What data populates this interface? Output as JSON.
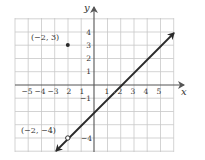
{
  "figure": {
    "type": "coordinate-graph",
    "colors": {
      "grid": "#c8c8c8",
      "axis": "#555555",
      "line": "#2a2a2a",
      "text": "#333333",
      "background": "#ffffff"
    },
    "axes": {
      "x_label": "x",
      "y_label": "y",
      "x_ticks": [
        {
          "value": -5,
          "label": "−5"
        },
        {
          "value": -4,
          "label": "−4"
        },
        {
          "value": -3,
          "label": "−3"
        },
        {
          "value": -2,
          "label": "2"
        },
        {
          "value": -1,
          "label": "1"
        },
        {
          "value": 1,
          "label": "1"
        },
        {
          "value": 2,
          "label": "2"
        },
        {
          "value": 3,
          "label": "3"
        },
        {
          "value": 4,
          "label": "4"
        },
        {
          "value": 5,
          "label": "5"
        }
      ],
      "y_ticks": [
        {
          "value": 4,
          "label": "4"
        },
        {
          "value": 3,
          "label": "3"
        },
        {
          "value": 2,
          "label": "2"
        },
        {
          "value": 1,
          "label": "1"
        },
        {
          "value": -1,
          "label": "−1"
        },
        {
          "value": -4,
          "label": "−4"
        }
      ],
      "x_range": [
        -6,
        6
      ],
      "y_range": [
        -5,
        5
      ]
    },
    "points": [
      {
        "x": -2,
        "y": 3,
        "label": "(−2, 3)",
        "style": "filled"
      },
      {
        "x": -2,
        "y": -4,
        "label": "(−2, −4)",
        "style": "open"
      }
    ],
    "line": {
      "equation": "y = x - 2",
      "slope": 1,
      "x_intercept": 2,
      "y_intercept": -2,
      "arrows": "both"
    }
  }
}
